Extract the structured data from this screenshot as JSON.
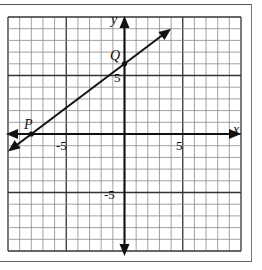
{
  "chart_data": {
    "type": "line",
    "title": "",
    "xlabel": "x",
    "ylabel": "y",
    "xlim": [
      -10,
      10
    ],
    "ylim": [
      -10,
      10
    ],
    "grid": true,
    "grid_major_every": 5,
    "tick_labels": {
      "x": [
        {
          "value": -5,
          "label": "-5"
        },
        {
          "value": 5,
          "label": "5"
        }
      ],
      "y": [
        {
          "value": 5,
          "label": "5"
        },
        {
          "value": -5,
          "label": "-5"
        }
      ]
    },
    "points": [
      {
        "name": "P",
        "x": -8,
        "y": 0
      },
      {
        "name": "Q",
        "x": 0,
        "y": 6
      }
    ],
    "series": [
      {
        "name": "line PQ",
        "equation": "y = 0.75x + 6",
        "x": [
          -10,
          4
        ],
        "y": [
          -1.5,
          9
        ],
        "arrows": "both"
      }
    ]
  },
  "labels": {
    "x_axis": "x",
    "y_axis": "y",
    "point_p": "P",
    "point_q": "Q",
    "tick_x_neg5": "-5",
    "tick_x_5": "5",
    "tick_y_5": "5",
    "tick_y_neg5": "-5"
  },
  "colors": {
    "grid_minor": "#8a8a8a",
    "grid_major": "#333333",
    "axis": "#111111",
    "line": "#111111"
  }
}
